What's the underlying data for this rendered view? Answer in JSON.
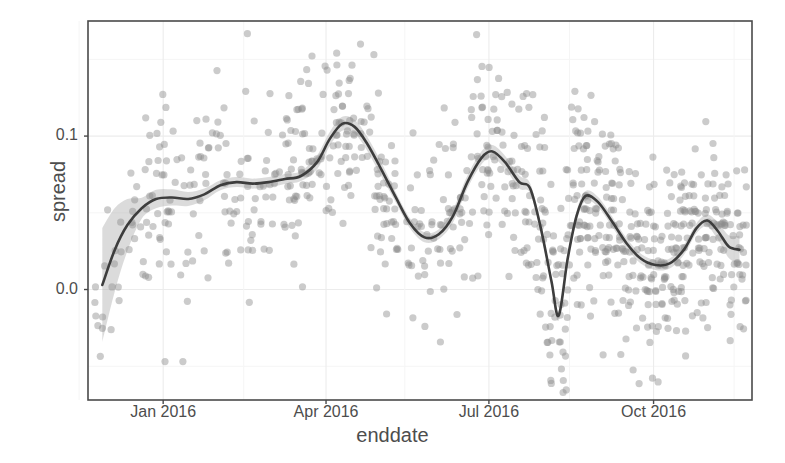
{
  "chart_data": {
    "type": "scatter",
    "title": "",
    "subtitle": "",
    "xlabel": "enddate",
    "ylabel": "spread",
    "grid": true,
    "legend": false,
    "legend_position": "none",
    "xlim": [
      "2015-11-20",
      "2016-11-25"
    ],
    "ylim": [
      -0.072,
      0.175
    ],
    "xticks": [
      {
        "label": "Jan 2016",
        "value": "2016-01-01"
      },
      {
        "label": "Apr 2016",
        "value": "2016-04-01"
      },
      {
        "label": "Jul 2016",
        "value": "2016-07-01"
      },
      {
        "label": "Oct 2016",
        "value": "2016-10-01"
      }
    ],
    "yticks": [
      {
        "label": "0.0",
        "value": 0.0
      },
      {
        "label": "0.1",
        "value": 0.1
      }
    ],
    "minor_yticks": [
      -0.05,
      0.05,
      0.15
    ],
    "colors": {
      "point": "#8c8c8c",
      "line": "#3d3d3d",
      "ribbon": "#b0b0b0",
      "panel_border": "#4a4a4a",
      "grid_major": "#ececec",
      "grid_minor": "#f5f5f5",
      "background": "#ffffff",
      "text": "#4d4d4d"
    },
    "point_opacity": 0.45,
    "point_radius": 3.6,
    "series": [
      {
        "name": "spread",
        "kind": "points",
        "n_points": 760,
        "x": "enddate (daily, Nov 2015 - Nov 2016)",
        "y": "spread (-0.07 to 0.17)"
      },
      {
        "name": "loess smooth",
        "kind": "line",
        "points": [
          {
            "x": "2015-11-28",
            "y": 0.003
          },
          {
            "x": "2015-12-05",
            "y": 0.026
          },
          {
            "x": "2015-12-12",
            "y": 0.042
          },
          {
            "x": "2015-12-20",
            "y": 0.053
          },
          {
            "x": "2015-12-28",
            "y": 0.059
          },
          {
            "x": "2016-01-06",
            "y": 0.06
          },
          {
            "x": "2016-01-15",
            "y": 0.059
          },
          {
            "x": "2016-01-24",
            "y": 0.062
          },
          {
            "x": "2016-02-02",
            "y": 0.068
          },
          {
            "x": "2016-02-11",
            "y": 0.07
          },
          {
            "x": "2016-02-20",
            "y": 0.069
          },
          {
            "x": "2016-02-29",
            "y": 0.07
          },
          {
            "x": "2016-03-09",
            "y": 0.072
          },
          {
            "x": "2016-03-18",
            "y": 0.074
          },
          {
            "x": "2016-03-27",
            "y": 0.083
          },
          {
            "x": "2016-04-03",
            "y": 0.098
          },
          {
            "x": "2016-04-10",
            "y": 0.108
          },
          {
            "x": "2016-04-17",
            "y": 0.106
          },
          {
            "x": "2016-04-24",
            "y": 0.095
          },
          {
            "x": "2016-05-02",
            "y": 0.078
          },
          {
            "x": "2016-05-10",
            "y": 0.06
          },
          {
            "x": "2016-05-18",
            "y": 0.043
          },
          {
            "x": "2016-05-26",
            "y": 0.034
          },
          {
            "x": "2016-06-03",
            "y": 0.036
          },
          {
            "x": "2016-06-11",
            "y": 0.048
          },
          {
            "x": "2016-06-19",
            "y": 0.07
          },
          {
            "x": "2016-06-27",
            "y": 0.086
          },
          {
            "x": "2016-07-03",
            "y": 0.09
          },
          {
            "x": "2016-07-10",
            "y": 0.083
          },
          {
            "x": "2016-07-18",
            "y": 0.07
          },
          {
            "x": "2016-07-24",
            "y": 0.066
          },
          {
            "x": "2016-07-30",
            "y": 0.04
          },
          {
            "x": "2016-08-05",
            "y": 0.005
          },
          {
            "x": "2016-08-09",
            "y": -0.017
          },
          {
            "x": "2016-08-14",
            "y": 0.02
          },
          {
            "x": "2016-08-19",
            "y": 0.048
          },
          {
            "x": "2016-08-24",
            "y": 0.061
          },
          {
            "x": "2016-08-31",
            "y": 0.057
          },
          {
            "x": "2016-09-08",
            "y": 0.044
          },
          {
            "x": "2016-09-16",
            "y": 0.03
          },
          {
            "x": "2016-09-24",
            "y": 0.02
          },
          {
            "x": "2016-10-02",
            "y": 0.016
          },
          {
            "x": "2016-10-10",
            "y": 0.017
          },
          {
            "x": "2016-10-18",
            "y": 0.026
          },
          {
            "x": "2016-10-25",
            "y": 0.04
          },
          {
            "x": "2016-10-31",
            "y": 0.045
          },
          {
            "x": "2016-11-06",
            "y": 0.038
          },
          {
            "x": "2016-11-12",
            "y": 0.028
          },
          {
            "x": "2016-11-18",
            "y": 0.026
          }
        ]
      }
    ]
  },
  "axes": {
    "x_label": "enddate",
    "y_label": "spread"
  }
}
